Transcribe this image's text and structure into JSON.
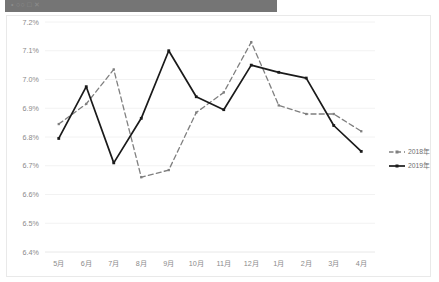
{
  "window": {
    "banner_text": "•                                                                              ○○  □ ✕"
  },
  "chart_data": {
    "type": "line",
    "title": "",
    "subtitle": "",
    "xlabel": "",
    "ylabel": "",
    "categories": [
      "5月",
      "6月",
      "7月",
      "8月",
      "9月",
      "10月",
      "11月",
      "12月",
      "1月",
      "2月",
      "3月",
      "4月"
    ],
    "series": [
      {
        "name": "2018年",
        "style": "dashed",
        "color": "#7f7f7f",
        "values": [
          6.845,
          6.915,
          7.035,
          6.66,
          6.685,
          6.885,
          6.955,
          7.13,
          6.91,
          6.88,
          6.88,
          6.82
        ]
      },
      {
        "name": "2019年",
        "style": "solid",
        "color": "#1a1a1a",
        "values": [
          6.795,
          6.975,
          6.71,
          6.865,
          7.1,
          6.94,
          6.895,
          7.05,
          7.025,
          7.005,
          6.84,
          6.75
        ]
      }
    ],
    "ylim": [
      6.4,
      7.2
    ],
    "ytick_labels": [
      "7.2%",
      "7.1%",
      "7.0%",
      "6.9%",
      "6.8%",
      "6.7%",
      "6.6%",
      "6.5%",
      "6.4%"
    ],
    "ytick_values": [
      7.2,
      7.1,
      7.0,
      6.9,
      6.8,
      6.7,
      6.6,
      6.5,
      6.4
    ],
    "grid": true,
    "legend_position": "right",
    "value_unit": "%",
    "colors": {
      "series_2018": "#7f7f7f",
      "series_2019": "#1a1a1a",
      "gridline": "#efefef",
      "tick_text": "#8a8a8a",
      "card_background": "#ffffff",
      "card_border": "#e9e9e9",
      "banner": "#757575"
    }
  },
  "legend": {
    "items": [
      {
        "label": "2018年"
      },
      {
        "label": "2019年"
      }
    ]
  }
}
